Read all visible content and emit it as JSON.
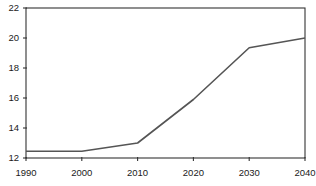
{
  "chart_data": {
    "type": "line",
    "title": "",
    "subtitle": "",
    "xlabel": "",
    "ylabel": "",
    "x": [
      1990,
      2000,
      2010,
      2020,
      2030,
      2040
    ],
    "xtick_labels": [
      "1990",
      "2000",
      "2010",
      "2020",
      "2030",
      "2040"
    ],
    "ytick_labels": [
      "12",
      "14",
      "16",
      "18",
      "20",
      "22"
    ],
    "ytick_values": [
      12,
      14,
      16,
      18,
      20,
      22
    ],
    "xlim": [
      1990,
      2040
    ],
    "ylim": [
      12,
      22
    ],
    "grid": false,
    "legend": false,
    "legend_position": "none",
    "series": [
      {
        "name": "",
        "values": [
          12.45,
          12.45,
          13.0,
          15.9,
          19.35,
          20.0
        ],
        "color": "#555555"
      }
    ],
    "annotations": []
  },
  "axes": {
    "frame_color": "#333333",
    "background": "#ffffff"
  }
}
